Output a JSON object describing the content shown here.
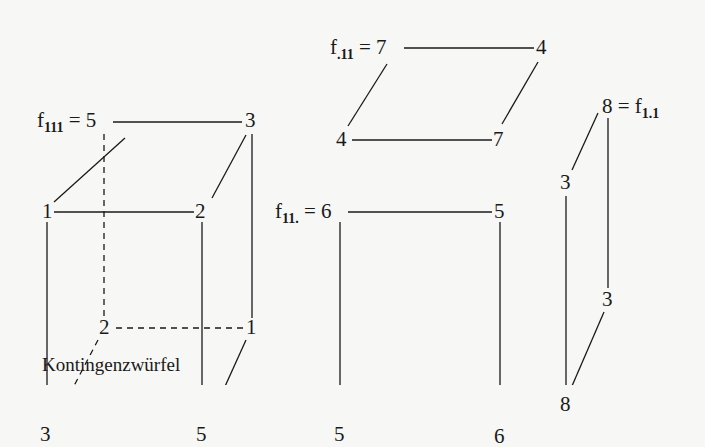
{
  "figure": {
    "caption": "Kontingenzwürfel",
    "cube": {
      "label_prefix": "f",
      "label_sub": "111",
      "label_eq": " = ",
      "top_back_left": "5",
      "top_back_right": "3",
      "top_front_left": "1",
      "top_front_right": "2",
      "bottom_back_left": "2",
      "bottom_back_right": "1",
      "bottom_front_left": "3",
      "bottom_front_right": "5"
    },
    "slab_top": {
      "label_prefix": "f",
      "label_sub": ".11",
      "label_eq": " = ",
      "back_left": "7",
      "back_right": "4",
      "front_left": "4",
      "front_right": "7"
    },
    "slab_front": {
      "label_prefix": "f",
      "label_sub": "11.",
      "label_eq": " = ",
      "top_left": "6",
      "top_right": "5",
      "bottom_left": "5",
      "bottom_right": "6"
    },
    "slab_side": {
      "label_suffix_eq": " = ",
      "label_prefix": "f",
      "label_sub": "1.1",
      "top_back": "8",
      "top_front": "3",
      "bottom_back": "3",
      "bottom_front": "8"
    }
  }
}
